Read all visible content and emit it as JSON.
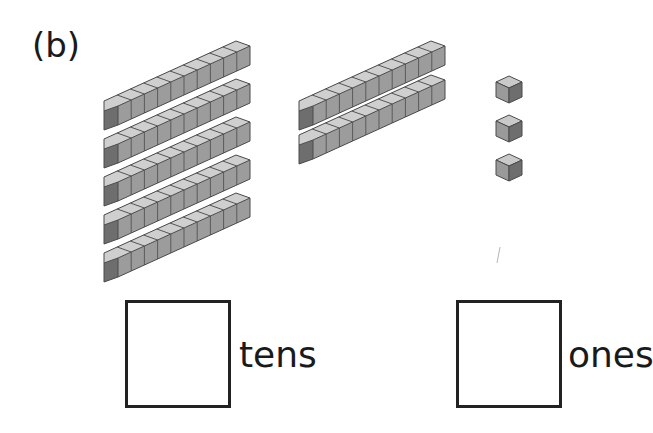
{
  "problem": {
    "label": "(b)"
  },
  "blocks": {
    "tens_rods_group1": 5,
    "tens_rods_group2": 2,
    "unit_cubes": 3
  },
  "answer_boxes": [
    {
      "unit": "tens",
      "value": ""
    },
    {
      "unit": "ones",
      "value": ""
    }
  ],
  "colors": {
    "top_face": "#c9c9c9",
    "front_face": "#9a9a9a",
    "side_face": "#6e6e6e",
    "edge": "#4a4a4a"
  }
}
